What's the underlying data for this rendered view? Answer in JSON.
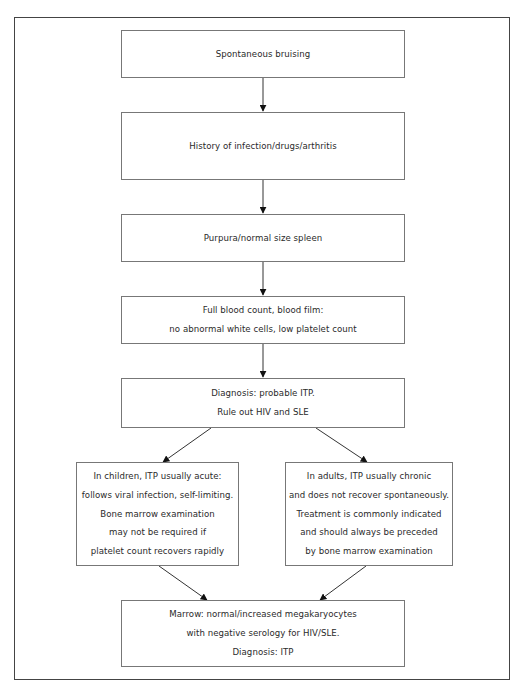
{
  "diagram": {
    "type": "flowchart",
    "nodes": [
      {
        "id": "n1",
        "lines": [
          "Spontaneous bruising"
        ]
      },
      {
        "id": "n2",
        "lines": [
          "History of infection/drugs/arthritis"
        ]
      },
      {
        "id": "n3",
        "lines": [
          "Purpura/normal size spleen"
        ]
      },
      {
        "id": "n4",
        "lines": [
          "Full blood count, blood film:",
          "no abnormal white cells, low platelet count"
        ]
      },
      {
        "id": "n5",
        "lines": [
          "Diagnosis: probable ITP.",
          "Rule out HIV and SLE"
        ]
      },
      {
        "id": "n6",
        "lines": [
          "In children, ITP usually acute:",
          "follows viral infection, self-limiting.",
          "Bone marrow examination",
          "may not be required if",
          "platelet count recovers rapidly"
        ]
      },
      {
        "id": "n7",
        "lines": [
          "In adults, ITP usually chronic",
          "and does not recover spontaneously.",
          "Treatment is commonly indicated",
          "and should always be preceded",
          "by bone marrow examination"
        ]
      },
      {
        "id": "n8",
        "lines": [
          "Marrow: normal/increased megakaryocytes",
          "with negative serology for HIV/SLE.",
          "Diagnosis: ITP"
        ]
      }
    ],
    "edges": [
      {
        "from": "n1",
        "to": "n2"
      },
      {
        "from": "n2",
        "to": "n3"
      },
      {
        "from": "n3",
        "to": "n4"
      },
      {
        "from": "n4",
        "to": "n5"
      },
      {
        "from": "n5",
        "to": "n6"
      },
      {
        "from": "n5",
        "to": "n7"
      },
      {
        "from": "n6",
        "to": "n8"
      },
      {
        "from": "n7",
        "to": "n8"
      }
    ]
  }
}
